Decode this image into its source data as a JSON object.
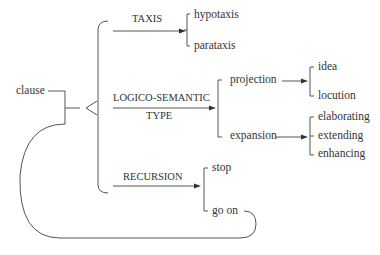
{
  "diagram": {
    "root": "clause",
    "systems": [
      {
        "name": "TAXIS",
        "options": [
          "hypotaxis",
          "parataxis"
        ]
      },
      {
        "name_line1": "LOGICO-SEMANTIC",
        "name_line2": "TYPE",
        "options": [
          {
            "label": "projection",
            "sub": [
              "idea",
              "locution"
            ]
          },
          {
            "label": "expansion",
            "sub": [
              "elaborating",
              "extending",
              "enhancing"
            ]
          }
        ]
      },
      {
        "name": "RECURSION",
        "options": [
          "stop",
          "go on"
        ]
      }
    ],
    "colors": {
      "line": "#555555",
      "text": "#333333"
    }
  }
}
